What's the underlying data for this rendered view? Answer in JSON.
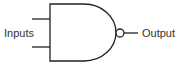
{
  "diagram": {
    "type": "logic-gate",
    "gate": "NAND",
    "labels": {
      "inputs": "Inputs",
      "output": "Output"
    },
    "colors": {
      "stroke": "#222222",
      "text": "#333333",
      "background": "#ffffff"
    }
  }
}
